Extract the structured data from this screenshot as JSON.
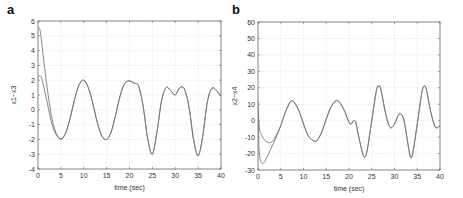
{
  "panels": [
    {
      "letter": "a"
    },
    {
      "letter": "b"
    }
  ],
  "chart_data": [
    {
      "type": "line",
      "panel": "a",
      "title": "",
      "xlabel": "time (sec)",
      "ylabel": "x1~x3",
      "xlim": [
        0,
        40
      ],
      "ylim": [
        -4,
        6
      ],
      "xticks": [
        0,
        5,
        10,
        15,
        20,
        25,
        30,
        35,
        40
      ],
      "yticks": [
        -4,
        -3,
        -2,
        -1,
        0,
        1,
        2,
        3,
        4,
        5,
        6
      ],
      "grid": true,
      "line_color": "#777777",
      "series": [
        {
          "name": "x1",
          "x": [
            0,
            0.5,
            1,
            2,
            3,
            4,
            5,
            6,
            7,
            8,
            9,
            10,
            11,
            12,
            13,
            14,
            15,
            16,
            17,
            18,
            19,
            20,
            21,
            22,
            23,
            24,
            25,
            26,
            27,
            28,
            29,
            30,
            31,
            32,
            33,
            34,
            35,
            36,
            37,
            38,
            39,
            40
          ],
          "y": [
            5.6,
            5.3,
            4.0,
            1.5,
            -0.5,
            -1.6,
            -2.0,
            -1.6,
            -0.6,
            0.7,
            1.7,
            2.0,
            1.5,
            0.4,
            -0.9,
            -1.8,
            -2.0,
            -1.5,
            -0.3,
            1.0,
            1.8,
            1.95,
            1.8,
            1.6,
            0.2,
            -2.0,
            -3.0,
            -1.5,
            0.6,
            1.5,
            1.3,
            1.0,
            1.5,
            1.4,
            0.2,
            -2.0,
            -3.1,
            -1.8,
            0.5,
            1.45,
            1.3,
            0.9
          ]
        },
        {
          "name": "x3",
          "x": [
            0,
            0.5,
            1,
            2,
            3,
            4,
            5,
            6,
            7,
            8,
            9,
            10,
            11,
            12,
            13,
            14,
            15,
            16,
            17,
            18,
            19,
            20,
            21,
            22,
            23,
            24,
            25,
            26,
            27,
            28,
            29,
            30,
            31,
            32,
            33,
            34,
            35,
            36,
            37,
            38,
            39,
            40
          ],
          "y": [
            2.2,
            2.3,
            1.9,
            0.5,
            -0.9,
            -1.7,
            -1.95,
            -1.6,
            -0.6,
            0.7,
            1.7,
            2.0,
            1.5,
            0.4,
            -0.9,
            -1.8,
            -2.0,
            -1.5,
            -0.3,
            1.0,
            1.8,
            1.95,
            1.8,
            1.6,
            0.2,
            -2.0,
            -3.0,
            -1.5,
            0.6,
            1.5,
            1.3,
            1.0,
            1.5,
            1.4,
            0.2,
            -2.0,
            -3.1,
            -1.8,
            0.5,
            1.45,
            1.3,
            0.9
          ]
        }
      ]
    },
    {
      "type": "line",
      "panel": "b",
      "title": "",
      "xlabel": "time (sec)",
      "ylabel": "x2~x4",
      "xlim": [
        0,
        40
      ],
      "ylim": [
        -30,
        60
      ],
      "xticks": [
        0,
        5,
        10,
        15,
        20,
        25,
        30,
        35,
        40
      ],
      "yticks": [
        -30,
        -20,
        -10,
        0,
        10,
        20,
        30,
        40,
        50,
        60
      ],
      "grid": true,
      "line_color": "#777777",
      "series": [
        {
          "name": "x2",
          "x": [
            0,
            0.3,
            1,
            2,
            3,
            4,
            5,
            6,
            7,
            7.5,
            8,
            9,
            10,
            11,
            12,
            12.5,
            13,
            14,
            15,
            16,
            17,
            17.5,
            18,
            19,
            20,
            20.5,
            21,
            21.5,
            22,
            23,
            23.5,
            24,
            25,
            26,
            26.5,
            27,
            28,
            29,
            30,
            31,
            32,
            33,
            33.5,
            34,
            35,
            36,
            36.5,
            37,
            38,
            39,
            40
          ],
          "y": [
            5,
            -20,
            -26,
            -22,
            -16,
            -10,
            -3,
            5,
            11,
            12,
            11,
            6,
            -2,
            -9,
            -12,
            -12.5,
            -12,
            -7,
            1,
            8,
            12,
            12,
            11,
            6,
            -1,
            -2,
            0,
            -1,
            -8,
            -20,
            -22,
            -18,
            0,
            18,
            21,
            19,
            5,
            -4,
            -2,
            4,
            1,
            -15,
            -22,
            -20,
            -2,
            17,
            21,
            19,
            5,
            -4,
            -3
          ]
        },
        {
          "name": "x4",
          "x": [
            0,
            0.3,
            1,
            2,
            3,
            4,
            5,
            6,
            7,
            7.5,
            8,
            9,
            10,
            11,
            12,
            12.5,
            13,
            14,
            15,
            16,
            17,
            17.5,
            18,
            19,
            20,
            20.5,
            21,
            21.5,
            22,
            23,
            23.5,
            24,
            25,
            26,
            26.5,
            27,
            28,
            29,
            30,
            31,
            32,
            33,
            33.5,
            34,
            35,
            36,
            36.5,
            37,
            38,
            39,
            40
          ],
          "y": [
            12,
            -4,
            -10,
            -13,
            -13,
            -9,
            -3,
            5,
            11,
            12,
            11,
            6,
            -2,
            -9,
            -12,
            -12.5,
            -12,
            -7,
            1,
            8,
            12,
            12,
            11,
            6,
            -1,
            -2,
            0,
            -1,
            -8,
            -20,
            -22,
            -18,
            0,
            18,
            21,
            19,
            5,
            -4,
            -2,
            4,
            1,
            -15,
            -22,
            -20,
            -2,
            17,
            21,
            19,
            5,
            -4,
            -3
          ]
        }
      ]
    }
  ]
}
